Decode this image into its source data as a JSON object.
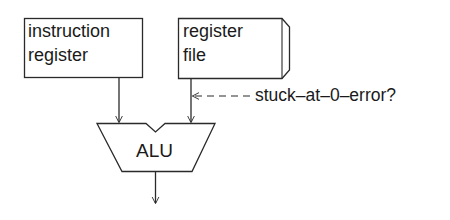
{
  "diagram": {
    "nodes": {
      "instruction_register": {
        "line1": "instruction",
        "line2": "register"
      },
      "register_file": {
        "line1": "register",
        "line2": "file"
      },
      "alu": {
        "label": "ALU"
      }
    },
    "annotation": {
      "label": "stuck–at–0–error?"
    },
    "edges": [
      {
        "from": "instruction_register",
        "to": "alu"
      },
      {
        "from": "register_file",
        "to": "alu"
      },
      {
        "from": "alu",
        "to": "output"
      },
      {
        "from": "annotation",
        "to": "register_file-alu edge",
        "style": "dashed"
      }
    ],
    "colors": {
      "stroke": "#2a2a2a",
      "background": "#ffffff"
    }
  }
}
